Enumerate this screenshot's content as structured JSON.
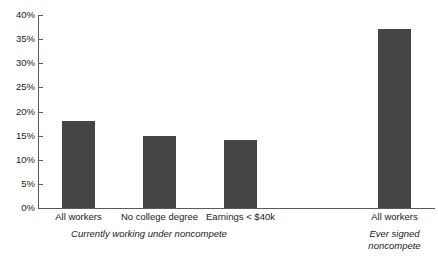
{
  "chart_data": {
    "type": "bar",
    "title": "",
    "xlabel": "",
    "ylabel": "",
    "ylim": [
      0,
      40
    ],
    "ytick_labels": [
      "0%",
      "5%",
      "10%",
      "15%",
      "20%",
      "25%",
      "30%",
      "35%",
      "40%"
    ],
    "ytick_values": [
      0,
      5,
      10,
      15,
      20,
      25,
      30,
      35,
      40
    ],
    "grid": false,
    "legend": "none",
    "bar_color": "#454545",
    "axis_color": "#5a5a5a",
    "background": "#ffffff",
    "categories": [
      "All workers",
      "No college degree",
      "Earnings < $40k",
      "All workers"
    ],
    "values": [
      18,
      15,
      14,
      37
    ],
    "groups": [
      {
        "caption_lines": [
          "Currently working under noncompete"
        ],
        "categories": [
          "All workers",
          "No college degree",
          "Earnings < $40k"
        ],
        "values": [
          18,
          15,
          14
        ]
      },
      {
        "caption_lines": [
          "Ever signed",
          "noncompete"
        ],
        "categories": [
          "All workers"
        ],
        "values": [
          37
        ]
      }
    ]
  },
  "axis": {
    "ticks": [
      {
        "label": "40%",
        "value": 40
      },
      {
        "label": "35%",
        "value": 35
      },
      {
        "label": "30%",
        "value": 30
      },
      {
        "label": "25%",
        "value": 25
      },
      {
        "label": "20%",
        "value": 20
      },
      {
        "label": "15%",
        "value": 15
      },
      {
        "label": "10%",
        "value": 10
      },
      {
        "label": "5%",
        "value": 5
      },
      {
        "label": "0%",
        "value": 0
      }
    ]
  },
  "bars": [
    {
      "label": "All workers",
      "value": 18
    },
    {
      "label": "No college degree",
      "value": 15
    },
    {
      "label": "Earnings < $40k",
      "value": 14
    },
    {
      "label": "All workers",
      "value": 37
    }
  ],
  "captions": {
    "group1_line1": "Currently working under noncompete",
    "group2_line1": "Ever signed",
    "group2_line2": "noncompete"
  }
}
